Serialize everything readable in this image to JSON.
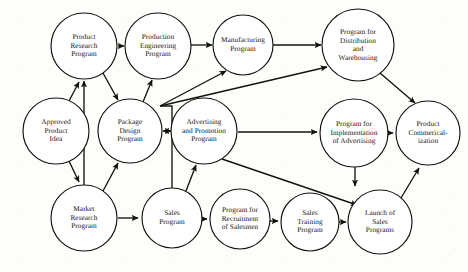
{
  "figure": {
    "type": "directed-network-diagram",
    "title": "",
    "background_color": "#fdfdfb",
    "node_fill": "#ffffff",
    "node_stroke": "#15120d",
    "edge_color": "#15120d",
    "text_color": "#17140f"
  },
  "nodes": [
    {
      "id": "approved_product_idea",
      "label": "Approved\nProduct\nIdea",
      "cx": 56,
      "cy": 131,
      "r": 33
    },
    {
      "id": "product_research",
      "label": "Product\nResearch\nProgram",
      "cx": 84,
      "cy": 46,
      "r": 33
    },
    {
      "id": "production_engineering",
      "label": "Production\nEngineering\nProgram",
      "cx": 158,
      "cy": 46,
      "r": 33
    },
    {
      "id": "manufacturing",
      "label": "Manufacturing\nProgram",
      "cx": 243,
      "cy": 45,
      "r": 30
    },
    {
      "id": "distribution_warehousing",
      "label": "Program for\nDistribution\nand\nWarehousing",
      "cx": 358,
      "cy": 45,
      "r": 36
    },
    {
      "id": "package_design",
      "label": "Package\nDesign\nProgram",
      "cx": 130,
      "cy": 131,
      "r": 32
    },
    {
      "id": "advertising_promotion",
      "label": "Advertising\nand Promotion\nProgram",
      "cx": 204,
      "cy": 131,
      "r": 33
    },
    {
      "id": "implementation_advertising",
      "label": "Program for\nImplementation\nof Advertising",
      "cx": 354,
      "cy": 133,
      "r": 34
    },
    {
      "id": "product_commercialization",
      "label": "Product\nCommerical-\nization",
      "cx": 428,
      "cy": 133,
      "r": 32
    },
    {
      "id": "market_research",
      "label": "Market\nResearch\nProgram",
      "cx": 84,
      "cy": 218,
      "r": 33
    },
    {
      "id": "sales_program",
      "label": "Sales\nProgram",
      "cx": 172,
      "cy": 218,
      "r": 30
    },
    {
      "id": "recruitment_salesmen",
      "label": "Program for\nRecruitment\nof Salesmen",
      "cx": 240,
      "cy": 219,
      "r": 30
    },
    {
      "id": "sales_training",
      "label": "Sales\nTraining\nProgram",
      "cx": 310,
      "cy": 222,
      "r": 29
    },
    {
      "id": "launch_sales_programs",
      "label": "Launch of\nSales\nPrograms",
      "cx": 380,
      "cy": 222,
      "r": 32
    }
  ],
  "edges": [
    {
      "id": "e1",
      "from": "approved_product_idea",
      "to": "product_research",
      "style": "straight"
    },
    {
      "id": "e2",
      "from": "approved_product_idea",
      "to": "market_research",
      "style": "straight"
    },
    {
      "id": "e3",
      "from": "market_research",
      "to": "product_research",
      "style": "straight"
    },
    {
      "id": "e4",
      "from": "market_research",
      "to": "package_design",
      "style": "straight"
    },
    {
      "id": "e5",
      "from": "product_research",
      "to": "package_design",
      "style": "straight"
    },
    {
      "id": "e6",
      "from": "product_research",
      "to": "production_engineering",
      "style": "straight"
    },
    {
      "id": "e7",
      "from": "package_design",
      "to": "production_engineering",
      "style": "straight"
    },
    {
      "id": "e8",
      "from": "package_design",
      "to": "advertising_promotion",
      "style": "bidirectional"
    },
    {
      "id": "e9",
      "from": "production_engineering",
      "to": "manufacturing",
      "style": "straight"
    },
    {
      "id": "e10",
      "from": "manufacturing",
      "to": "distribution_warehousing",
      "style": "straight"
    },
    {
      "id": "e11",
      "from": "sales_program",
      "to": "manufacturing",
      "style": "elbow-junction"
    },
    {
      "id": "e12",
      "from": "sales_program",
      "to": "distribution_warehousing",
      "style": "elbow-junction"
    },
    {
      "id": "e13",
      "from": "market_research",
      "to": "sales_program",
      "style": "straight"
    },
    {
      "id": "e14",
      "from": "sales_program",
      "to": "advertising_promotion",
      "style": "straight"
    },
    {
      "id": "e15",
      "from": "advertising_promotion",
      "to": "implementation_advertising",
      "style": "straight"
    },
    {
      "id": "e16",
      "from": "advertising_promotion",
      "to": "launch_sales_programs",
      "style": "straight"
    },
    {
      "id": "e17",
      "from": "implementation_advertising",
      "to": "product_commercialization",
      "style": "straight"
    },
    {
      "id": "e18",
      "from": "implementation_advertising",
      "to": "launch_sales_programs",
      "style": "straight"
    },
    {
      "id": "e19",
      "from": "distribution_warehousing",
      "to": "product_commercialization",
      "style": "straight"
    },
    {
      "id": "e20",
      "from": "sales_program",
      "to": "recruitment_salesmen",
      "style": "straight"
    },
    {
      "id": "e21",
      "from": "recruitment_salesmen",
      "to": "sales_training",
      "style": "straight"
    },
    {
      "id": "e22",
      "from": "sales_training",
      "to": "launch_sales_programs",
      "style": "straight"
    },
    {
      "id": "e23",
      "from": "launch_sales_programs",
      "to": "product_commercialization",
      "style": "straight"
    }
  ]
}
